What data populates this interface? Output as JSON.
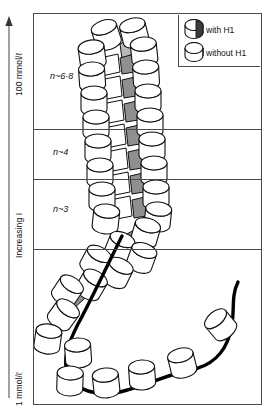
{
  "figure": {
    "axis": {
      "name": "ionic-strength-axis",
      "top_label": "100 mmol/ℓ",
      "mid_label": "Increasing I",
      "bottom_label": "1 mmol/ℓ",
      "arrow_direction": "up",
      "line_color": "#555555"
    },
    "legend": {
      "items": [
        {
          "label": "with H1",
          "icon": "nucleosome-cylinder-shaded-icon",
          "shaded": true
        },
        {
          "label": "without H1",
          "icon": "nucleosome-cylinder-open-icon",
          "shaded": false
        }
      ]
    },
    "zones": [
      {
        "id": "zone-solenoid",
        "n_label": "n~6·8",
        "top": 0,
        "height": 115,
        "state": "30 nm solenoid fibre"
      },
      {
        "id": "zone-n4",
        "n_label": "n~4",
        "top": 115,
        "height": 50,
        "state": "partially condensed fibre"
      },
      {
        "id": "zone-n3",
        "n_label": "n~3",
        "top": 165,
        "height": 70,
        "state": "loosely coiled fibre"
      },
      {
        "id": "zone-beads",
        "n_label": "",
        "top": 235,
        "height": 157,
        "state": "beads-on-a-string"
      }
    ],
    "dividers": [
      115,
      165,
      235
    ],
    "colors": {
      "frame": "#4a4a4a",
      "outline": "#111111",
      "dna_strand": "#000000",
      "linker_shade": "#9a9a9a",
      "fill": "#ffffff"
    }
  }
}
